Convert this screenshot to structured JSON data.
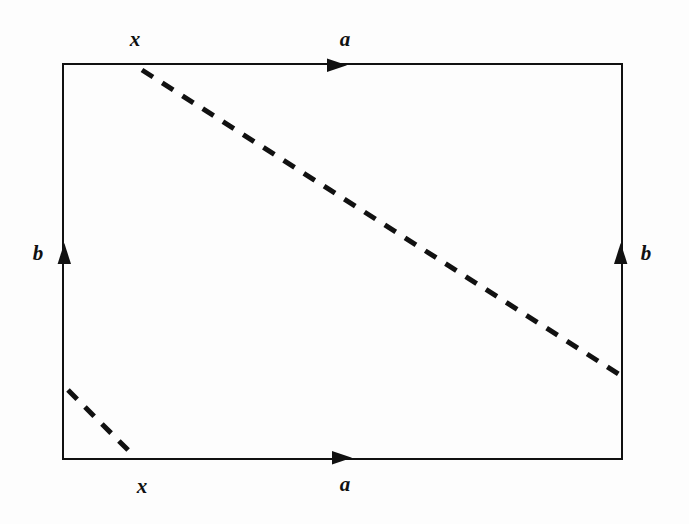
{
  "figure": {
    "type": "topology-identification-diagram",
    "background_color": "#fdfdfd",
    "ink_color": "#111111",
    "rectangle": {
      "x1": 63,
      "y1": 64,
      "x2": 622,
      "y2": 459,
      "stroke_width": 2.6
    },
    "edge_arrows": [
      {
        "name": "top-edge-arrow",
        "direction": "right",
        "x": 340,
        "y": 65.3
      },
      {
        "name": "bottom-edge-arrow",
        "direction": "right",
        "x": 345,
        "y": 457.7
      },
      {
        "name": "left-edge-arrow",
        "direction": "up",
        "x": 64.3,
        "y": 253
      },
      {
        "name": "right-edge-arrow",
        "direction": "up",
        "x": 620.7,
        "y": 253
      }
    ],
    "dashed_lines": [
      {
        "name": "main-diagonal",
        "x1": 142,
        "y1": 70,
        "x2": 620,
        "y2": 375,
        "dash": "13 11",
        "stroke_width": 5
      },
      {
        "name": "short-corner",
        "x1": 68,
        "y1": 390,
        "x2": 130,
        "y2": 452,
        "dash": "13 11",
        "stroke_width": 5
      }
    ],
    "labels": {
      "x_top": "x",
      "a_top": "a",
      "b_left": "b",
      "b_right": "b",
      "x_bottom": "x",
      "a_bottom": "a"
    }
  }
}
